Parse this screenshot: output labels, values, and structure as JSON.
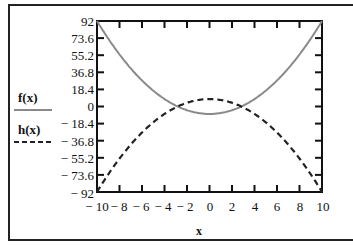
{
  "chart_data": {
    "type": "line",
    "title": "",
    "xlabel": "x",
    "ylabel": "",
    "xlim": [
      -10,
      10
    ],
    "ylim": [
      -92,
      92
    ],
    "x_ticks": [
      "-10",
      "-8",
      "-6",
      "-4",
      "-2",
      "0",
      "2",
      "4",
      "6",
      "8",
      "10"
    ],
    "y_ticks": [
      "92",
      "73.6",
      "55.2",
      "36.8",
      "18.4",
      "0",
      "-18.4",
      "-36.8",
      "-55.2",
      "-73.6",
      "-92"
    ],
    "grid": false,
    "legend_position": "left",
    "x": [
      -10,
      -8,
      -6,
      -4,
      -2,
      0,
      2,
      4,
      6,
      8,
      10
    ],
    "series": [
      {
        "name": "f(x)",
        "style": "solid",
        "color": "#8a8a8a",
        "values": [
          92,
          56,
          28,
          8,
          -4,
          -8,
          -4,
          8,
          28,
          56,
          92
        ]
      },
      {
        "name": "h(x)",
        "style": "dashed",
        "color": "#222222",
        "values": [
          -92,
          -56,
          -28,
          -8,
          4,
          8,
          4,
          -8,
          -28,
          -56,
          -92
        ]
      }
    ]
  },
  "legend": {
    "f_label": "f(x)",
    "h_label": "h(x)"
  },
  "axis": {
    "x_title": "x",
    "y_tick_labels": [
      "92",
      "73.6",
      "55.2",
      "36.8",
      "18.4",
      "0",
      "− 18.4",
      "− 36.8",
      "− 55.2",
      "− 73.6",
      "− 92"
    ],
    "x_tick_labels": [
      "− 10",
      "− 8",
      "− 6",
      "− 4",
      "− 2",
      "0",
      "2",
      "4",
      "6",
      "8",
      "10"
    ]
  }
}
